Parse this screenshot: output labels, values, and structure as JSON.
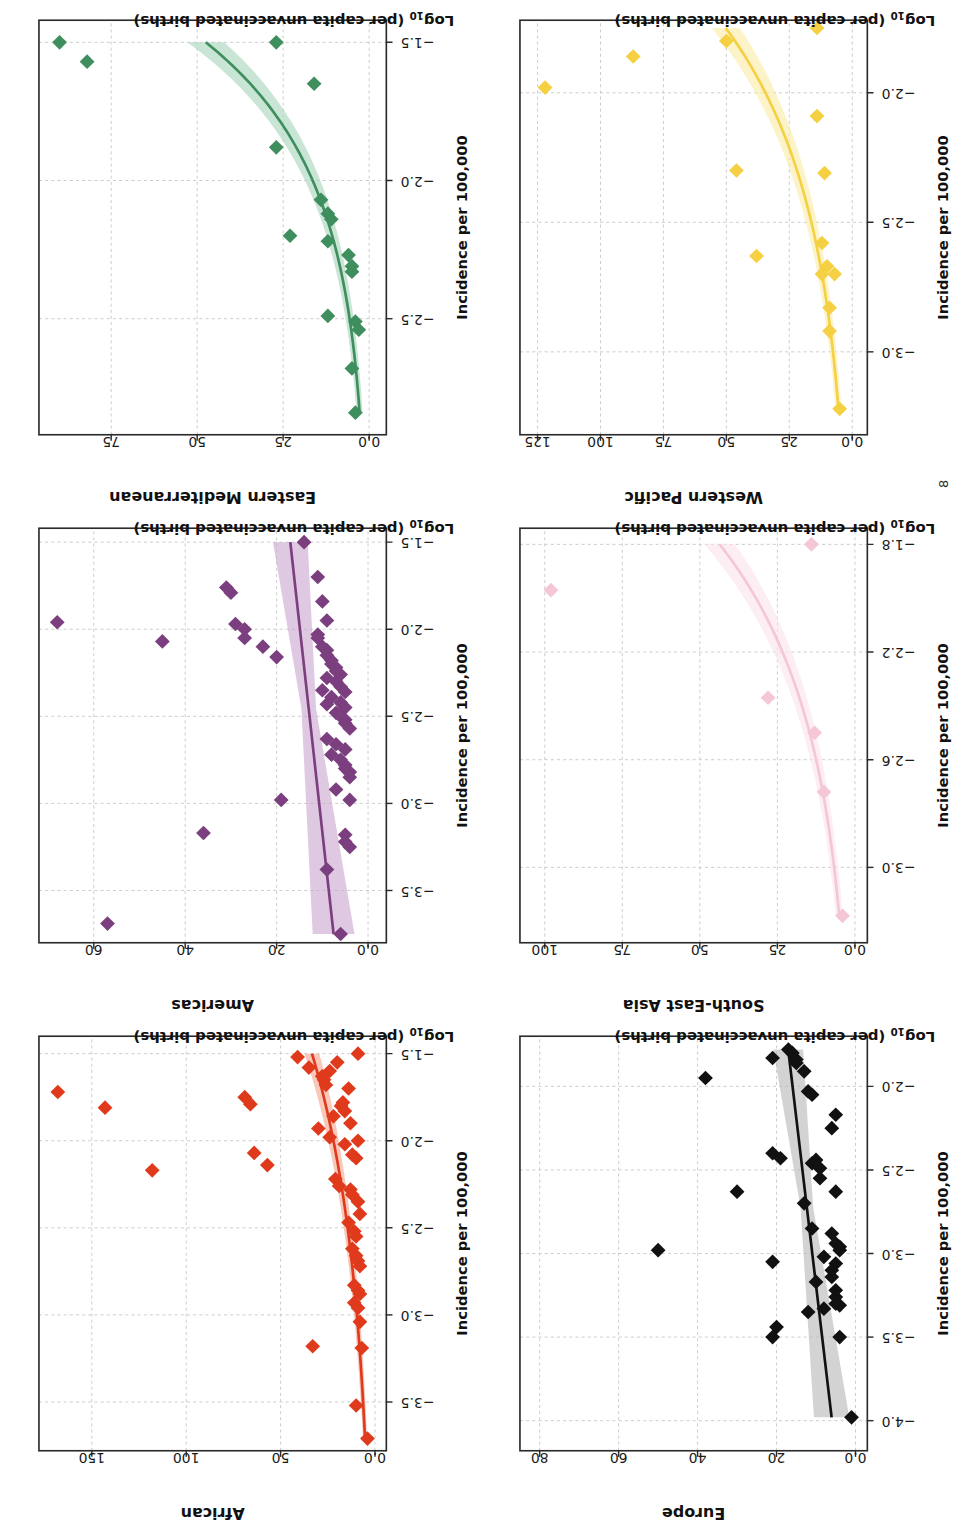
{
  "figure": {
    "page_number": "8",
    "panel_order": [
      "african",
      "americas",
      "eastern_mediterranean",
      "europe",
      "south_east_asia",
      "western_pacific"
    ]
  },
  "labels": {
    "x_axis": "Log₁₀ (per capita unvaccinated births)",
    "x_axis_main": "Log",
    "x_axis_sub": "10",
    "x_axis_rest": " (per capita unvaccinated births)",
    "y_axis": "Incidence per 100,000"
  },
  "chart_data": [
    {
      "type": "scatter",
      "title": "African",
      "xlabel": "Log10 (per capita unvaccinated births)",
      "ylabel": "Incidence per 100,000",
      "color": "#E03A1C",
      "band_color": "#F6A68F",
      "xlim": [
        -3.78,
        -1.4
      ],
      "ylim": [
        -6,
        178
      ],
      "xticks": [
        -3.5,
        -3.0,
        -2.5,
        -2.0,
        -1.5
      ],
      "yticks": [
        0,
        50,
        100,
        150
      ],
      "grid": true,
      "fit_type": "exponential",
      "points": [
        {
          "x": -1.72,
          "y": 168
        },
        {
          "x": -1.81,
          "y": 143
        },
        {
          "x": -2.17,
          "y": 118
        },
        {
          "x": -1.75,
          "y": 69
        },
        {
          "x": -1.79,
          "y": 66
        },
        {
          "x": -2.07,
          "y": 64
        },
        {
          "x": -2.14,
          "y": 57
        },
        {
          "x": -3.18,
          "y": 33
        },
        {
          "x": -1.52,
          "y": 41
        },
        {
          "x": -1.58,
          "y": 35
        },
        {
          "x": -1.63,
          "y": 28
        },
        {
          "x": -1.65,
          "y": 27
        },
        {
          "x": -1.68,
          "y": 26
        },
        {
          "x": -1.6,
          "y": 24
        },
        {
          "x": -1.93,
          "y": 30
        },
        {
          "x": -1.98,
          "y": 24
        },
        {
          "x": -1.86,
          "y": 22
        },
        {
          "x": -1.8,
          "y": 18
        },
        {
          "x": -1.78,
          "y": 17
        },
        {
          "x": -1.83,
          "y": 16
        },
        {
          "x": -1.7,
          "y": 14
        },
        {
          "x": -2.02,
          "y": 16
        },
        {
          "x": -2.08,
          "y": 12
        },
        {
          "x": -2.0,
          "y": 9
        },
        {
          "x": -2.22,
          "y": 21
        },
        {
          "x": -2.26,
          "y": 19
        },
        {
          "x": -2.28,
          "y": 13
        },
        {
          "x": -2.31,
          "y": 12
        },
        {
          "x": -2.47,
          "y": 14
        },
        {
          "x": -2.52,
          "y": 11
        },
        {
          "x": -2.55,
          "y": 10
        },
        {
          "x": -2.62,
          "y": 12
        },
        {
          "x": -2.66,
          "y": 10
        },
        {
          "x": -2.69,
          "y": 9
        },
        {
          "x": -2.72,
          "y": 8
        },
        {
          "x": -2.83,
          "y": 11
        },
        {
          "x": -2.86,
          "y": 9
        },
        {
          "x": -2.88,
          "y": 8
        },
        {
          "x": -2.93,
          "y": 11
        },
        {
          "x": -2.96,
          "y": 9
        },
        {
          "x": -3.04,
          "y": 8
        },
        {
          "x": -3.19,
          "y": 7
        },
        {
          "x": -3.52,
          "y": 10
        },
        {
          "x": -3.71,
          "y": 4
        },
        {
          "x": -1.9,
          "y": 13
        },
        {
          "x": -2.1,
          "y": 10
        },
        {
          "x": -2.35,
          "y": 9
        },
        {
          "x": -1.55,
          "y": 20
        },
        {
          "x": -1.5,
          "y": 9
        },
        {
          "x": -2.42,
          "y": 8
        }
      ]
    },
    {
      "type": "scatter",
      "title": "Americas",
      "xlabel": "Log10 (per capita unvaccinated births)",
      "ylabel": "Incidence per 100,000",
      "color": "#7B3F7F",
      "band_color": "#CBA6CE",
      "xlim": [
        -3.8,
        -1.42
      ],
      "ylim": [
        -4,
        72
      ],
      "xticks": [
        -3.5,
        -3.0,
        -2.5,
        -2.0,
        -1.5
      ],
      "yticks": [
        0,
        20,
        40,
        60
      ],
      "grid": true,
      "fit_type": "linear",
      "points": [
        {
          "x": -1.96,
          "y": 68
        },
        {
          "x": -3.69,
          "y": 57
        },
        {
          "x": -2.07,
          "y": 45
        },
        {
          "x": -3.17,
          "y": 36
        },
        {
          "x": -1.79,
          "y": 30
        },
        {
          "x": -1.76,
          "y": 31
        },
        {
          "x": -1.97,
          "y": 29
        },
        {
          "x": -2.0,
          "y": 27
        },
        {
          "x": -2.05,
          "y": 27
        },
        {
          "x": -2.1,
          "y": 23
        },
        {
          "x": -2.16,
          "y": 20
        },
        {
          "x": -2.98,
          "y": 19
        },
        {
          "x": -1.5,
          "y": 14
        },
        {
          "x": -1.7,
          "y": 11
        },
        {
          "x": -1.84,
          "y": 10
        },
        {
          "x": -1.95,
          "y": 9
        },
        {
          "x": -2.03,
          "y": 11
        },
        {
          "x": -2.05,
          "y": 11
        },
        {
          "x": -2.1,
          "y": 10
        },
        {
          "x": -2.12,
          "y": 9
        },
        {
          "x": -2.15,
          "y": 9
        },
        {
          "x": -2.18,
          "y": 8
        },
        {
          "x": -2.2,
          "y": 8
        },
        {
          "x": -2.22,
          "y": 7
        },
        {
          "x": -2.24,
          "y": 7
        },
        {
          "x": -2.26,
          "y": 6
        },
        {
          "x": -2.28,
          "y": 9
        },
        {
          "x": -2.3,
          "y": 7
        },
        {
          "x": -2.33,
          "y": 6
        },
        {
          "x": -2.36,
          "y": 5
        },
        {
          "x": -2.39,
          "y": 8
        },
        {
          "x": -2.42,
          "y": 6
        },
        {
          "x": -2.45,
          "y": 5
        },
        {
          "x": -2.48,
          "y": 7
        },
        {
          "x": -2.5,
          "y": 6
        },
        {
          "x": -2.52,
          "y": 5
        },
        {
          "x": -2.54,
          "y": 5
        },
        {
          "x": -2.57,
          "y": 4
        },
        {
          "x": -2.63,
          "y": 9
        },
        {
          "x": -2.66,
          "y": 7
        },
        {
          "x": -2.69,
          "y": 5
        },
        {
          "x": -2.72,
          "y": 8
        },
        {
          "x": -2.75,
          "y": 6
        },
        {
          "x": -2.78,
          "y": 5
        },
        {
          "x": -2.8,
          "y": 5
        },
        {
          "x": -2.82,
          "y": 4
        },
        {
          "x": -2.85,
          "y": 4
        },
        {
          "x": -2.92,
          "y": 7
        },
        {
          "x": -2.98,
          "y": 4
        },
        {
          "x": -3.18,
          "y": 5
        },
        {
          "x": -3.22,
          "y": 5
        },
        {
          "x": -3.25,
          "y": 4
        },
        {
          "x": -3.38,
          "y": 9
        },
        {
          "x": -3.75,
          "y": 6
        },
        {
          "x": -2.43,
          "y": 9
        },
        {
          "x": -2.35,
          "y": 10
        }
      ]
    },
    {
      "type": "scatter",
      "title": "Eastern Mediterranean",
      "xlabel": "Log10 (per capita unvaccinated births)",
      "ylabel": "Incidence per 100,000",
      "color": "#3E8E5E",
      "band_color": "#A8D5BC",
      "xlim": [
        -2.92,
        -1.42
      ],
      "ylim": [
        -5,
        96
      ],
      "xticks": [
        -2.5,
        -2.0,
        -1.5
      ],
      "yticks": [
        0,
        25,
        50,
        75
      ],
      "grid": true,
      "fit_type": "exponential",
      "points": [
        {
          "x": -1.5,
          "y": 90
        },
        {
          "x": -1.57,
          "y": 82
        },
        {
          "x": -1.5,
          "y": 27
        },
        {
          "x": -1.65,
          "y": 16
        },
        {
          "x": -1.88,
          "y": 27
        },
        {
          "x": -2.07,
          "y": 14
        },
        {
          "x": -2.12,
          "y": 12
        },
        {
          "x": -2.14,
          "y": 11
        },
        {
          "x": -2.2,
          "y": 23
        },
        {
          "x": -2.22,
          "y": 12
        },
        {
          "x": -2.27,
          "y": 6
        },
        {
          "x": -2.31,
          "y": 5
        },
        {
          "x": -2.33,
          "y": 5
        },
        {
          "x": -2.49,
          "y": 12
        },
        {
          "x": -2.51,
          "y": 4
        },
        {
          "x": -2.54,
          "y": 3
        },
        {
          "x": -2.68,
          "y": 5
        },
        {
          "x": -2.84,
          "y": 4
        }
      ]
    },
    {
      "type": "scatter",
      "title": "Europe",
      "xlabel": "Log10 (per capita unvaccinated births)",
      "ylabel": "Incidence per 100,000",
      "color": "#111111",
      "band_color": "#B8B8B8",
      "xlim": [
        -4.18,
        -1.7
      ],
      "ylim": [
        -3,
        85
      ],
      "xticks": [
        -4.0,
        -3.5,
        -3.0,
        -2.5,
        -2.0
      ],
      "yticks": [
        0,
        20,
        40,
        60,
        80
      ],
      "grid": true,
      "fit_type": "linear",
      "points": [
        {
          "x": -1.95,
          "y": 38
        },
        {
          "x": -2.98,
          "y": 50
        },
        {
          "x": -2.63,
          "y": 30
        },
        {
          "x": -1.83,
          "y": 21
        },
        {
          "x": -2.4,
          "y": 21
        },
        {
          "x": -2.43,
          "y": 19
        },
        {
          "x": -3.05,
          "y": 21
        },
        {
          "x": -3.5,
          "y": 21
        },
        {
          "x": -3.44,
          "y": 20
        },
        {
          "x": -1.78,
          "y": 17
        },
        {
          "x": -1.8,
          "y": 16
        },
        {
          "x": -1.84,
          "y": 15
        },
        {
          "x": -1.86,
          "y": 15
        },
        {
          "x": -1.91,
          "y": 13
        },
        {
          "x": -2.03,
          "y": 12
        },
        {
          "x": -2.05,
          "y": 11
        },
        {
          "x": -2.46,
          "y": 11
        },
        {
          "x": -2.44,
          "y": 10
        },
        {
          "x": -2.49,
          "y": 9
        },
        {
          "x": -2.55,
          "y": 9
        },
        {
          "x": -2.7,
          "y": 13
        },
        {
          "x": -2.63,
          "y": 5
        },
        {
          "x": -2.85,
          "y": 11
        },
        {
          "x": -2.88,
          "y": 6
        },
        {
          "x": -2.94,
          "y": 5
        },
        {
          "x": -2.96,
          "y": 4
        },
        {
          "x": -2.98,
          "y": 4
        },
        {
          "x": -3.02,
          "y": 8
        },
        {
          "x": -3.06,
          "y": 5
        },
        {
          "x": -3.1,
          "y": 6
        },
        {
          "x": -3.14,
          "y": 6
        },
        {
          "x": -3.17,
          "y": 10
        },
        {
          "x": -3.22,
          "y": 5
        },
        {
          "x": -3.26,
          "y": 5
        },
        {
          "x": -3.3,
          "y": 5
        },
        {
          "x": -3.31,
          "y": 4
        },
        {
          "x": -3.33,
          "y": 8
        },
        {
          "x": -3.35,
          "y": 12
        },
        {
          "x": -3.5,
          "y": 4
        },
        {
          "x": -3.98,
          "y": 1
        },
        {
          "x": -2.25,
          "y": 6
        },
        {
          "x": -2.17,
          "y": 5
        }
      ]
    },
    {
      "type": "scatter",
      "title": "South-East Asia",
      "xlabel": "Log10 (per capita unvaccinated births)",
      "ylabel": "Incidence per 100,000",
      "color": "#F4C6D6",
      "band_color": "#FBE4EC",
      "xlim": [
        -3.28,
        -1.74
      ],
      "ylim": [
        -4,
        108
      ],
      "xticks": [
        -3.0,
        -2.6,
        -2.2,
        -1.8
      ],
      "yticks": [
        0,
        25,
        50,
        75,
        100
      ],
      "grid": true,
      "fit_type": "exponential",
      "points": [
        {
          "x": -1.97,
          "y": 98
        },
        {
          "x": -1.8,
          "y": 14
        },
        {
          "x": -2.37,
          "y": 28
        },
        {
          "x": -2.5,
          "y": 13
        },
        {
          "x": -2.72,
          "y": 10
        },
        {
          "x": -3.18,
          "y": 4
        }
      ]
    },
    {
      "type": "scatter",
      "title": "Western Pacific",
      "xlabel": "Log10 (per capita unvaccinated births)",
      "ylabel": "Incidence per 100,000",
      "color": "#F5D042",
      "band_color": "#FBEBA6",
      "xlim": [
        -3.32,
        -1.72
      ],
      "ylim": [
        -6,
        132
      ],
      "xticks": [
        -3.0,
        -2.5,
        -2.0
      ],
      "yticks": [
        0,
        25,
        50,
        75,
        100,
        125
      ],
      "grid": true,
      "fit_type": "exponential",
      "points": [
        {
          "x": -1.98,
          "y": 122
        },
        {
          "x": -1.86,
          "y": 87
        },
        {
          "x": -1.8,
          "y": 50
        },
        {
          "x": -2.3,
          "y": 46
        },
        {
          "x": -2.63,
          "y": 38
        },
        {
          "x": -1.75,
          "y": 14
        },
        {
          "x": -2.09,
          "y": 14
        },
        {
          "x": -2.31,
          "y": 11
        },
        {
          "x": -2.58,
          "y": 12
        },
        {
          "x": -2.67,
          "y": 10
        },
        {
          "x": -2.7,
          "y": 7
        },
        {
          "x": -2.7,
          "y": 12
        },
        {
          "x": -2.83,
          "y": 9
        },
        {
          "x": -2.92,
          "y": 9
        },
        {
          "x": -3.22,
          "y": 5
        }
      ]
    }
  ]
}
